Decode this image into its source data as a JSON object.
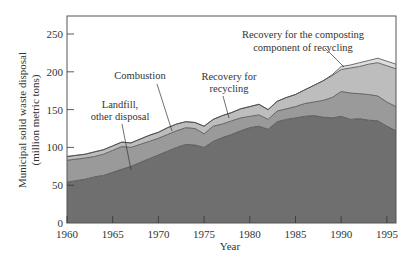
{
  "chart_data": {
    "type": "area",
    "stacked": true,
    "title": "",
    "xlabel": "Year",
    "ylabel": "Municipal solid waste disposal (million metric tons)",
    "ylabel_lines": [
      "Municipal solid waste disposal",
      "(million metric tons)"
    ],
    "xlim": [
      1960,
      1996
    ],
    "ylim": [
      0,
      270
    ],
    "x_ticks": [
      1960,
      1965,
      1970,
      1975,
      1980,
      1985,
      1990,
      1995
    ],
    "y_ticks": [
      0,
      50,
      100,
      150,
      200,
      250
    ],
    "grid": false,
    "legend": "none (inline annotations)",
    "x": [
      1960,
      1962,
      1963,
      1964,
      1965,
      1966,
      1967,
      1968,
      1969,
      1970,
      1971,
      1972,
      1973,
      1974,
      1975,
      1976,
      1977,
      1978,
      1979,
      1980,
      1981,
      1982,
      1983,
      1984,
      1985,
      1986,
      1987,
      1988,
      1989,
      1990,
      1991,
      1992,
      1993,
      1994,
      1995,
      1996
    ],
    "series": [
      {
        "name": "Landfill, other disposal",
        "color": "#6f6f6f",
        "values": [
          54,
          58,
          61,
          63,
          67,
          71,
          75,
          80,
          85,
          90,
          95,
          100,
          104,
          103,
          100,
          108,
          113,
          117,
          122,
          126,
          128,
          124,
          134,
          137,
          139,
          141,
          142,
          140,
          139,
          141,
          137,
          138,
          136,
          135,
          128,
          122
        ]
      },
      {
        "name": "Combustion",
        "color": "#9a9a9a",
        "values": [
          29,
          28,
          27,
          28,
          29,
          30,
          25,
          24,
          23,
          22,
          22,
          22,
          22,
          22,
          18,
          20,
          18,
          18,
          17,
          15,
          15,
          13,
          14,
          14,
          15,
          17,
          18,
          22,
          27,
          33,
          35,
          33,
          34,
          33,
          32,
          32
        ]
      },
      {
        "name": "Recovery for recycling",
        "color": "#bdbdbd",
        "values": [
          5,
          5,
          6,
          6,
          6,
          6,
          6,
          7,
          8,
          8,
          9,
          9,
          8,
          8,
          10,
          9,
          11,
          11,
          12,
          13,
          14,
          13,
          13,
          15,
          16,
          18,
          22,
          26,
          29,
          29,
          33,
          36,
          40,
          44,
          48,
          50
        ]
      },
      {
        "name": "Recovery for the composting component of recycling",
        "color": "#dedede",
        "values": [
          0,
          0,
          0,
          0,
          0,
          0,
          0,
          0,
          0,
          0,
          0,
          0,
          0,
          0,
          0,
          0,
          0,
          0,
          0,
          0,
          0,
          0,
          0,
          0,
          0,
          0,
          0,
          0,
          1,
          4,
          4,
          5,
          5,
          6,
          6,
          6
        ]
      }
    ],
    "annotations": [
      {
        "text": [
          "Landfill,",
          "other disposal"
        ],
        "target_series": "Landfill, other disposal"
      },
      {
        "text": [
          "Combustion"
        ],
        "target_series": "Combustion"
      },
      {
        "text": [
          "Recovery for",
          "recycling"
        ],
        "target_series": "Recovery for recycling"
      },
      {
        "text": [
          "Recovery for the composting",
          "component of recycling"
        ],
        "target_series": "Recovery for the composting component of recycling"
      }
    ]
  },
  "labels": {
    "xlabel": "Year",
    "ylabel_1": "Municipal solid waste disposal",
    "ylabel_2": "(million metric tons)",
    "ann_landfill_1": "Landfill,",
    "ann_landfill_2": "other disposal",
    "ann_combustion": "Combustion",
    "ann_recycling_1": "Recovery for",
    "ann_recycling_2": "recycling",
    "ann_compost_1": "Recovery for the composting",
    "ann_compost_2": "component of recycling"
  }
}
